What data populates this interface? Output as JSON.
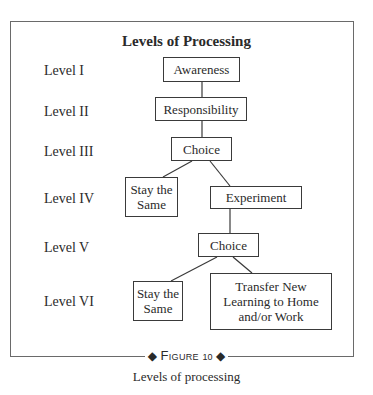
{
  "diagram": {
    "title": "Levels of Processing",
    "levels": [
      "Level I",
      "Level II",
      "Level III",
      "Level IV",
      "Level V",
      "Level VI"
    ],
    "nodes": {
      "awareness": "Awareness",
      "responsibility": "Responsibility",
      "choice_1": "Choice",
      "stay_same_1_line1": "Stay the",
      "stay_same_1_line2": "Same",
      "experiment": "Experiment",
      "choice_2": "Choice",
      "stay_same_2_line1": "Stay the",
      "stay_same_2_line2": "Same",
      "transfer_line1": "Transfer New",
      "transfer_line2": "Learning to Home",
      "transfer_line3": "and/or Work"
    },
    "edges": [
      [
        "Awareness",
        "Responsibility"
      ],
      [
        "Responsibility",
        "Choice (III)"
      ],
      [
        "Choice (III)",
        "Stay the Same (IV)"
      ],
      [
        "Choice (III)",
        "Experiment"
      ],
      [
        "Experiment",
        "Choice (V)"
      ],
      [
        "Choice (V)",
        "Stay the Same (VI)"
      ],
      [
        "Choice (V)",
        "Transfer New Learning to Home and/or Work"
      ]
    ]
  },
  "figure": {
    "word": "Figure",
    "number": "10",
    "ornament": "◆",
    "caption": "Levels of processing"
  }
}
